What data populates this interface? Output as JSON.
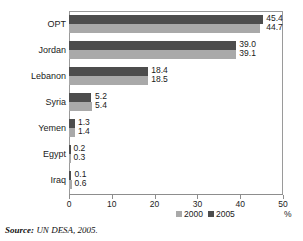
{
  "chart_data": {
    "type": "bar",
    "orientation": "horizontal",
    "title": "",
    "xlabel": "%",
    "ylabel": "",
    "xlim": [
      0,
      50
    ],
    "xticks": [
      0,
      10,
      20,
      30,
      40,
      50
    ],
    "xtick_labels": [
      "0",
      "10",
      "20",
      "30",
      "40",
      "50"
    ],
    "grid": false,
    "legend_position": "bottom-center",
    "categories": [
      "OPT",
      "Jordan",
      "Lebanon",
      "Syria",
      "Yemen",
      "Egypt",
      "Iraq"
    ],
    "series": [
      {
        "name": "2000",
        "color": "#a9a9a9",
        "values": [
          44.7,
          39.1,
          18.5,
          5.4,
          1.4,
          0.3,
          0.6
        ],
        "labels": [
          "44.7",
          "39.1",
          "18.5",
          "5.4",
          "1.4",
          "0.3",
          "0.6"
        ]
      },
      {
        "name": "2005",
        "color": "#4d4d4d",
        "values": [
          45.4,
          39.0,
          18.4,
          5.2,
          1.3,
          0.2,
          0.1
        ],
        "labels": [
          "45.4",
          "39.0",
          "18.4",
          "5.2",
          "1.3",
          "0.2",
          "0.1"
        ]
      }
    ]
  },
  "legend": {
    "items": [
      {
        "label": "2000",
        "color": "#a9a9a9"
      },
      {
        "label": "2005",
        "color": "#4d4d4d"
      }
    ]
  },
  "axis": {
    "unit": "%",
    "ticks": [
      "0",
      "10",
      "20",
      "30",
      "40",
      "50"
    ]
  },
  "source": {
    "label": "Source:",
    "text": "UN DESA, 2005."
  },
  "title_sliver": "",
  "colors": {
    "series_2000": "#a9a9a9",
    "series_2005": "#4d4d4d",
    "frame": "#9a9a9a"
  }
}
